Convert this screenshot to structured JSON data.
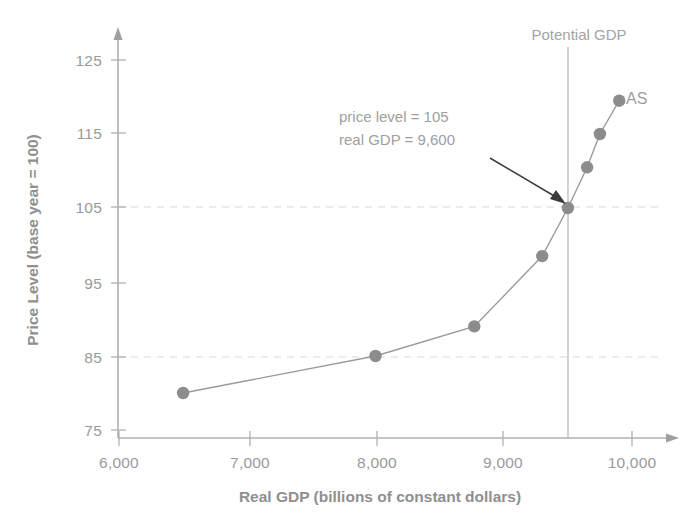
{
  "chart_data": {
    "type": "line",
    "title": "",
    "xlabel": "Real GDP (billions of constant dollars)",
    "ylabel": "Price Level (base year = 100)",
    "xlim": [
      6000,
      10200
    ],
    "ylim": [
      75,
      128
    ],
    "xticks": [
      6000,
      7000,
      8000,
      9000,
      10000
    ],
    "xticklabels": [
      "6,000",
      "7,000",
      "8,000",
      "9,000",
      "10,000"
    ],
    "yticks": [
      75,
      85,
      95,
      105,
      115,
      125
    ],
    "yticklabels": [
      "75",
      "85",
      "95",
      "105",
      "115",
      "125"
    ],
    "grid": "dashed horizontal gridlines at y=85 and y=105 only",
    "legend": "none",
    "series": [
      {
        "name": "AS",
        "label": "AS",
        "marker": "filled circle",
        "color": "#8c8c8c",
        "x": [
          6500,
          8000,
          8770,
          9300,
          9500,
          9650,
          9750,
          9900
        ],
        "y": [
          80,
          85,
          89,
          98.5,
          105,
          110.5,
          115,
          119.5
        ],
        "points": [
          {
            "gdp": 6500,
            "price_level": 80
          },
          {
            "gdp": 8000,
            "price_level": 85
          },
          {
            "gdp": 8770,
            "price_level": 89
          },
          {
            "gdp": 9300,
            "price_level": 98.5
          },
          {
            "gdp": 9500,
            "price_level": 105
          },
          {
            "gdp": 9650,
            "price_level": 110.5
          },
          {
            "gdp": 9750,
            "price_level": 115
          },
          {
            "gdp": 9900,
            "price_level": 119.5
          }
        ]
      }
    ],
    "annotations": [
      {
        "name": "equilibrium-callout",
        "line1": "price level = 105",
        "line2": "real GDP = 9,600",
        "target_gdp": 9500,
        "target_price_level": 105,
        "arrow": true
      },
      {
        "name": "potential-gdp-line",
        "label": "Potential GDP",
        "gdp": 9500,
        "style": "solid vertical line"
      }
    ],
    "gridlines": [
      {
        "axis": "y",
        "value": 105,
        "style": "dashed"
      },
      {
        "axis": "y",
        "value": 85,
        "style": "dashed"
      }
    ],
    "colors": {
      "axis": "#b0b0b0",
      "marker": "#8c8c8c",
      "curve": "#9a9a9a",
      "grid": "#d8d8d8",
      "text": "#9a9a9a",
      "arrow": "#3c3c3c",
      "potential_line": "#b5b5b5",
      "background": "#ffffff"
    }
  },
  "labels": {
    "y_axis_title": "Price Level (base year = 100)",
    "x_axis_title": "Real GDP (billions of constant dollars)",
    "curve_name": "AS",
    "potential_gdp": "Potential GDP",
    "callout_line1": "price level = 105",
    "callout_line2": "real GDP = 9,600",
    "y_ticks": [
      "125",
      "115",
      "105",
      "95",
      "85",
      "75"
    ],
    "x_ticks": [
      "6,000",
      "7,000",
      "8,000",
      "9,000",
      "10,000"
    ]
  }
}
